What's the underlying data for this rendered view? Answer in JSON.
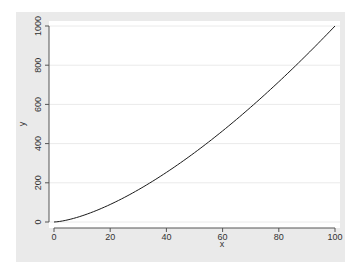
{
  "chart_data": {
    "type": "line",
    "title": "",
    "xlabel": "x",
    "ylabel": "y",
    "xlim": [
      0,
      100
    ],
    "ylim": [
      0,
      1000
    ],
    "xticks": [
      0,
      20,
      40,
      60,
      80,
      100
    ],
    "yticks": [
      0,
      200,
      400,
      600,
      800,
      1000
    ],
    "xtick_labels": [
      "0",
      "20",
      "40",
      "60",
      "80",
      "100"
    ],
    "ytick_labels": [
      "0",
      "200",
      "400",
      "600",
      "800",
      "1000"
    ],
    "grid": true,
    "legend": false,
    "series": [
      {
        "name": "y",
        "function": "y = x^1.5",
        "x": [
          0,
          5,
          10,
          15,
          20,
          25,
          30,
          35,
          40,
          45,
          50,
          55,
          60,
          65,
          70,
          75,
          80,
          85,
          90,
          95,
          100
        ],
        "y": [
          0,
          11.2,
          31.6,
          58.1,
          89.4,
          125,
          164.3,
          207.1,
          253,
          301.9,
          353.6,
          407.9,
          464.8,
          524.0,
          585.7,
          649.5,
          715.5,
          783.7,
          853.8,
          926.0,
          1000
        ]
      }
    ]
  },
  "colors": {
    "background_panel": "#eaeaea",
    "plot_region": "#ffffff",
    "line": "#1a1a1a",
    "gridline": "#eaeaea",
    "axis": "#555555"
  }
}
